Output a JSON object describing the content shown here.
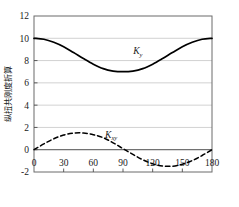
{
  "chart_data": {
    "type": "line",
    "title": "",
    "xlabel": "θ/(°)",
    "ylabel": "纵扭共刚度折算",
    "xlim": [
      0,
      180
    ],
    "ylim": [
      -2,
      12
    ],
    "xticks": [
      0,
      30,
      60,
      90,
      120,
      150,
      180
    ],
    "xtick_labels": [
      "0",
      "30",
      "60",
      "90",
      "120",
      "150",
      "180"
    ],
    "yticks": [
      -2,
      0,
      2,
      4,
      6,
      8,
      10,
      12
    ],
    "ytick_labels": [
      "-2",
      "0",
      "2",
      "4",
      "6",
      "8",
      "10",
      "12"
    ],
    "grid": true,
    "grid_axis": "y",
    "legend": "inline-annotations",
    "series": [
      {
        "name": "K_y",
        "label_main": "K",
        "label_sub": "y",
        "style": "solid",
        "color": "#000000",
        "x": [
          0,
          10,
          20,
          30,
          40,
          50,
          60,
          70,
          80,
          90,
          100,
          110,
          120,
          130,
          140,
          150,
          160,
          170,
          180
        ],
        "values": [
          10.0,
          9.91,
          9.64,
          9.24,
          8.72,
          8.18,
          7.68,
          7.28,
          7.06,
          7.0,
          7.06,
          7.28,
          7.68,
          8.18,
          8.72,
          9.24,
          9.64,
          9.91,
          10.0
        ]
      },
      {
        "name": "K_xy",
        "label_main": "K",
        "label_sub": "xy",
        "style": "dashed",
        "color": "#000000",
        "x": [
          0,
          10,
          20,
          30,
          40,
          50,
          60,
          70,
          80,
          90,
          100,
          110,
          120,
          130,
          140,
          150,
          160,
          170,
          180
        ],
        "values": [
          0.0,
          0.52,
          0.98,
          1.32,
          1.49,
          1.5,
          1.35,
          1.08,
          0.62,
          0.1,
          -0.42,
          -0.9,
          -1.26,
          -1.46,
          -1.48,
          -1.3,
          -0.98,
          -0.52,
          0.0
        ]
      }
    ],
    "annotations": [
      {
        "text": "K_y",
        "x": 105,
        "y": 8.55
      },
      {
        "text": "K_xy",
        "x": 78,
        "y": 1.05
      }
    ],
    "colors": {
      "axis": "#4d4d4d",
      "grid": "#bdbdbd",
      "curve": "#000000",
      "text": "#1a1a1a",
      "background": "#ffffff"
    }
  }
}
